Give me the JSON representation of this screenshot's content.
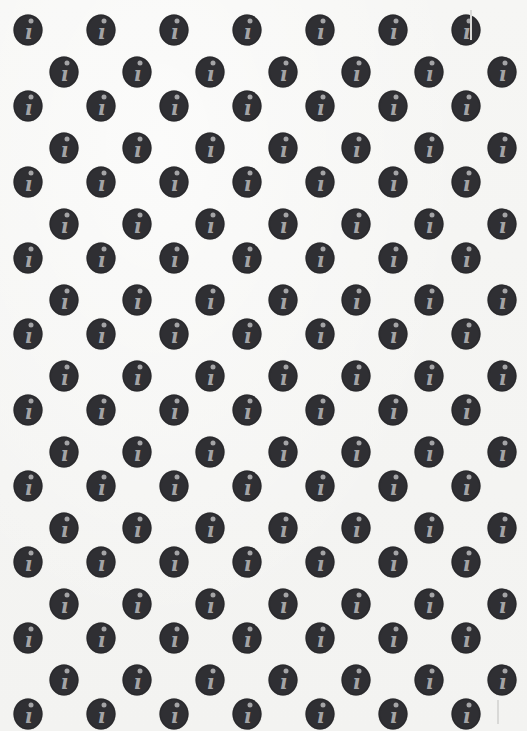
{
  "pattern": {
    "background_color": "#f7f7f5",
    "icon_fill": "#2f2f33",
    "glyph_color": "#a4a4a6",
    "icon": "info-icon",
    "glyph": "ı",
    "rows": 19,
    "icons_per_row": 7,
    "row_spacing_px": 38,
    "col_spacing_px": 73,
    "first_row_y": 30,
    "odd_row_start_x": 28,
    "even_row_start_x": 64
  }
}
